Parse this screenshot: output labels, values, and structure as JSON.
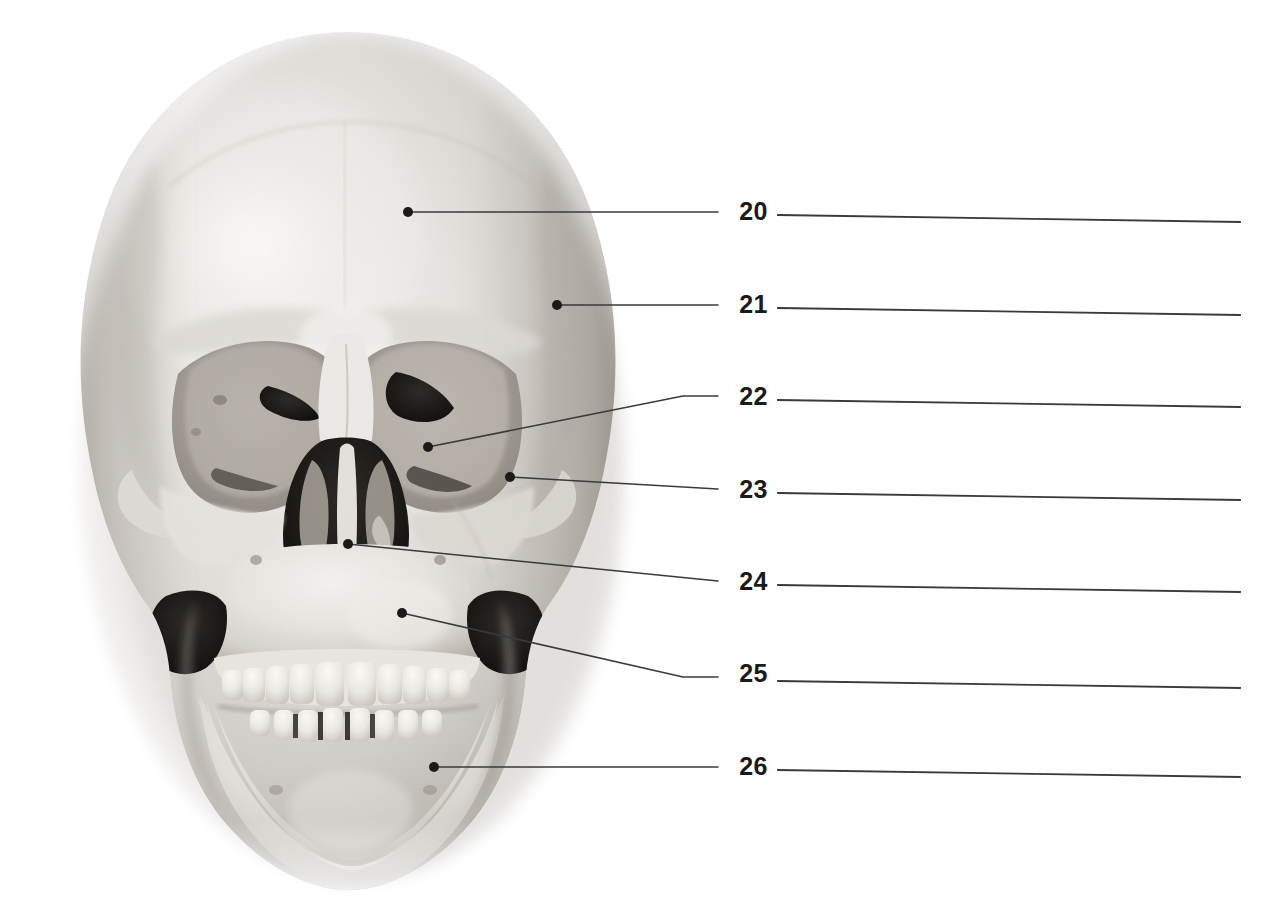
{
  "document": {
    "kind": "anatomy-labeling-worksheet",
    "subject": "human-skull-anterior-view",
    "background_color": "#ffffff",
    "ink_color": "#231f20",
    "line_color": "#3a3a3a"
  },
  "figure": {
    "name": "skull-anterior-view-photograph",
    "alt": "Anterior view photograph of a human skull",
    "bounds": {
      "x": 48,
      "y": 30,
      "width": 600,
      "height": 870
    }
  },
  "callouts": [
    {
      "number": "20",
      "label_x": 726,
      "label_y": 199,
      "dot": {
        "x": 408,
        "y": 212
      },
      "leader_points": "408,212 718,212",
      "answer_line": {
        "x1": 778,
        "y1": 215,
        "x2": 1240,
        "y2": 222
      },
      "target": "frontal-bone"
    },
    {
      "number": "21",
      "label_x": 726,
      "label_y": 292,
      "dot": {
        "x": 557,
        "y": 305
      },
      "leader_points": "557,305 718,305",
      "answer_line": {
        "x1": 778,
        "y1": 308,
        "x2": 1240,
        "y2": 315
      },
      "target": "parietal-bone"
    },
    {
      "number": "22",
      "label_x": 726,
      "label_y": 384,
      "dot": {
        "x": 428,
        "y": 447
      },
      "leader_points": "428,447 683,396 718,396",
      "answer_line": {
        "x1": 778,
        "y1": 400,
        "x2": 1240,
        "y2": 407
      },
      "target": "superior-orbital-fissure"
    },
    {
      "number": "23",
      "label_x": 726,
      "label_y": 477,
      "dot": {
        "x": 510,
        "y": 477
      },
      "leader_points": "510,477 718,489",
      "answer_line": {
        "x1": 778,
        "y1": 493,
        "x2": 1240,
        "y2": 500
      },
      "target": "zygomatic-bone"
    },
    {
      "number": "24",
      "label_x": 726,
      "label_y": 569,
      "dot": {
        "x": 348,
        "y": 544
      },
      "leader_points": "348,544 718,581",
      "answer_line": {
        "x1": 778,
        "y1": 585,
        "x2": 1240,
        "y2": 592
      },
      "target": "middle-nasal-concha"
    },
    {
      "number": "25",
      "label_x": 726,
      "label_y": 661,
      "dot": {
        "x": 402,
        "y": 613
      },
      "leader_points": "402,613 683,677 718,677",
      "answer_line": {
        "x1": 778,
        "y1": 681,
        "x2": 1240,
        "y2": 688
      },
      "target": "maxilla"
    },
    {
      "number": "26",
      "label_x": 726,
      "label_y": 754,
      "dot": {
        "x": 434,
        "y": 767
      },
      "leader_points": "434,767 718,767",
      "answer_line": {
        "x1": 778,
        "y1": 770,
        "x2": 1240,
        "y2": 777
      },
      "target": "mandible"
    }
  ]
}
